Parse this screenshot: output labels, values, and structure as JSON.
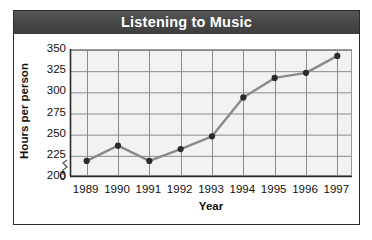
{
  "chart_data": {
    "type": "line",
    "title": "Listening to Music",
    "xlabel": "Year",
    "ylabel": "Hours per person",
    "categories": [
      "1989",
      "1990",
      "1991",
      "1992",
      "1993",
      "1994",
      "1995",
      "1996",
      "1997"
    ],
    "values": [
      219,
      237,
      219,
      233,
      248,
      294,
      317,
      323,
      343
    ],
    "series": [
      {
        "name": "Hours per person",
        "values": [
          219,
          237,
          219,
          233,
          248,
          294,
          317,
          323,
          343
        ]
      }
    ],
    "ylim": [
      200,
      350
    ],
    "yticks": [
      "350",
      "325",
      "300",
      "275",
      "250",
      "225",
      "200",
      "0"
    ],
    "ytick_values": [
      350,
      325,
      300,
      275,
      250,
      225,
      200,
      0
    ],
    "axis_break": true,
    "grid": true,
    "legend": "none",
    "colors": {
      "title_banner": "#4a4a4a",
      "title_text": "#ffffff",
      "plot_background": "#f2f2f2",
      "gridline": "#8c8c8c",
      "line": "#8a8a8a",
      "marker": "#2a2a2a",
      "axis": "#2b2b2b",
      "card_background": "#ffffff",
      "page_background": "#ffffff"
    }
  },
  "labels": {
    "title": "Listening to Music",
    "y_axis_title": "Hours per person",
    "x_axis_title": "Year"
  }
}
